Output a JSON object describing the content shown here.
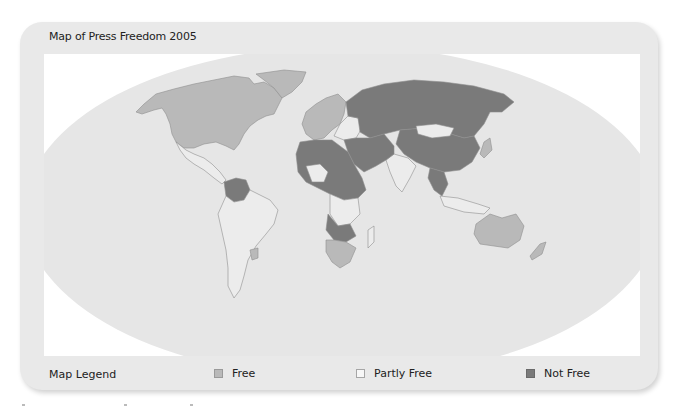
{
  "map": {
    "title": "Map of Press Freedom 2005",
    "projection": "world-oval",
    "colors": {
      "ocean": "#e6e6e6",
      "free": "#b9b9b9",
      "partly_free": "#ececec",
      "not_free": "#7a7a7a",
      "border": "#8e8e8e",
      "frame": "#e9e9e9",
      "inner_background": "#ffffff"
    },
    "regions": [
      {
        "name": "North America (USA, Canada)",
        "status": "free"
      },
      {
        "name": "Greenland",
        "status": "free"
      },
      {
        "name": "Mexico & Central America",
        "status": "partly_free"
      },
      {
        "name": "Venezuela / Colombia region",
        "status": "not_free"
      },
      {
        "name": "South America",
        "status": "partly_free"
      },
      {
        "name": "Western Europe",
        "status": "free"
      },
      {
        "name": "Russia & Central Asia",
        "status": "not_free"
      },
      {
        "name": "China",
        "status": "not_free"
      },
      {
        "name": "Mongolia",
        "status": "partly_free"
      },
      {
        "name": "India",
        "status": "partly_free"
      },
      {
        "name": "North Africa & Middle East",
        "status": "not_free"
      },
      {
        "name": "Southern Africa",
        "status": "free"
      },
      {
        "name": "Australia",
        "status": "free"
      },
      {
        "name": "New Zealand",
        "status": "free"
      },
      {
        "name": "Japan",
        "status": "free"
      }
    ]
  },
  "legend": {
    "title": "Map Legend",
    "items": [
      {
        "label": "Free",
        "color": "#b9b9b9",
        "icon": "free-swatch"
      },
      {
        "label": "Partly Free",
        "color": "#f4f4f4",
        "icon": "partly-free-swatch"
      },
      {
        "label": "Not Free",
        "color": "#7a7a7a",
        "icon": "not-free-swatch"
      }
    ]
  }
}
